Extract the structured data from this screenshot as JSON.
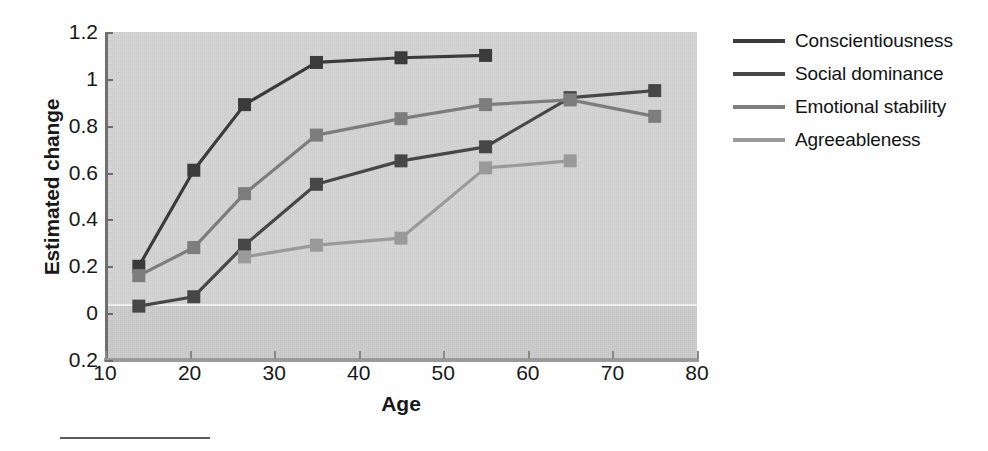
{
  "chart_data": {
    "type": "line",
    "title": "",
    "xlabel": "Age",
    "ylabel": "Estimated change",
    "xlim": [
      10,
      80
    ],
    "ylim": [
      -0.2,
      1.2
    ],
    "xticks": [
      10,
      20,
      30,
      40,
      50,
      60,
      70,
      80
    ],
    "xticklabels": [
      "10",
      "20",
      "30",
      "40",
      "50",
      "60",
      "70",
      "80"
    ],
    "yticks": [
      -0.2,
      0,
      0.2,
      0.4,
      0.6,
      0.8,
      1.0,
      1.2
    ],
    "yticklabels": [
      "0.2",
      "0",
      "0.2",
      "0.4",
      "0.6",
      "0.8",
      "1",
      "1.2"
    ],
    "grid": false,
    "legend_position": "right",
    "plot_background": "#d3d3d3",
    "marker": "square",
    "series": [
      {
        "name": "Conscientiousness",
        "color": "#3b3b3b",
        "x": [
          14,
          20.5,
          26.5,
          35,
          45,
          55
        ],
        "values": [
          0.2,
          0.61,
          0.89,
          1.07,
          1.09,
          1.1
        ]
      },
      {
        "name": "Social dominance",
        "color": "#474747",
        "x": [
          14,
          20.5,
          26.5,
          35,
          45,
          55,
          65,
          75
        ],
        "values": [
          0.03,
          0.07,
          0.29,
          0.55,
          0.65,
          0.71,
          0.92,
          0.95
        ]
      },
      {
        "name": "Emotional stability",
        "color": "#7d7d7d",
        "x": [
          14,
          20.5,
          26.5,
          35,
          45,
          55,
          65,
          75
        ],
        "values": [
          0.16,
          0.28,
          0.51,
          0.76,
          0.83,
          0.89,
          0.91,
          0.84
        ]
      },
      {
        "name": "Agreeableness",
        "color": "#9a9a9a",
        "x": [
          26.5,
          35,
          45,
          55,
          65
        ],
        "values": [
          0.24,
          0.29,
          0.32,
          0.62,
          0.65
        ]
      }
    ]
  },
  "axes": {
    "ylabel": "Estimated change",
    "xlabel": "Age"
  },
  "legend": {
    "items": [
      {
        "label": "Conscientiousness",
        "color": "#3b3b3b"
      },
      {
        "label": "Social dominance",
        "color": "#474747"
      },
      {
        "label": "Emotional stability",
        "color": "#7d7d7d"
      },
      {
        "label": "Agreeableness",
        "color": "#9a9a9a"
      }
    ]
  }
}
